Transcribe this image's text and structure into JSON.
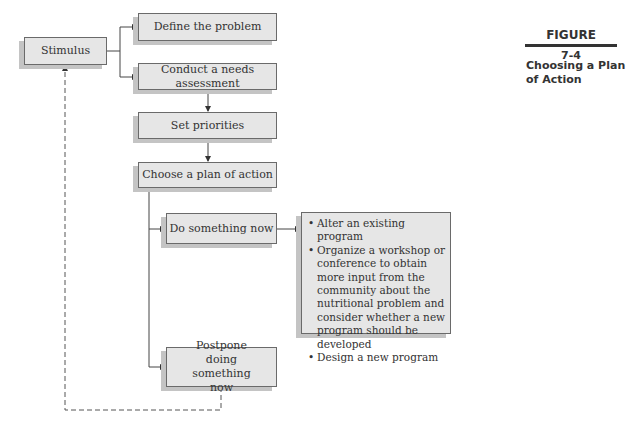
{
  "figure": {
    "label": "FIGURE",
    "number": "7-4",
    "caption": "Choosing a Plan of Action"
  },
  "nodes": {
    "stimulus": "Stimulus",
    "define": "Define the problem",
    "assess": "Conduct a needs assessment",
    "priorities": "Set priorities",
    "choose": "Choose a plan of action",
    "do_now": "Do something now",
    "postpone": "Postpone doing something now"
  },
  "options": [
    "Alter an existing program",
    "Organize a workshop or conference to obtain more input from the community about the nutritional problem and consider whether a new program should be developed",
    "Design a new program"
  ],
  "colors": {
    "box_fill": "#e6e6e6",
    "box_shadow": "#c4c4c4",
    "line": "#444444"
  }
}
